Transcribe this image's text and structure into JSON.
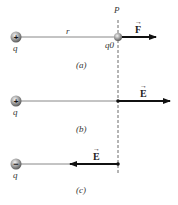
{
  "diagram": {
    "point_label": "P",
    "panels": [
      {
        "caption": "(a)",
        "charge_label": "q",
        "charge_sign": "+",
        "distance_label": "r",
        "test_charge_label": "q0",
        "vector_label": "F",
        "vector_direction": "right"
      },
      {
        "caption": "(b)",
        "charge_label": "q",
        "charge_sign": "+",
        "vector_label": "E",
        "vector_direction": "right"
      },
      {
        "caption": "(c)",
        "charge_label": "q",
        "charge_sign": "−",
        "vector_label": "E",
        "vector_direction": "left"
      }
    ]
  }
}
